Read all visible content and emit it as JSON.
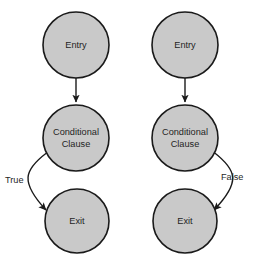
{
  "diagram": {
    "type": "flowchart",
    "title": "",
    "background_color": "#ffffff",
    "node_fill_color": "#c9c9c9",
    "node_stroke_color": "#1a1a1a",
    "text_color": "#1f1f1f",
    "columns": [
      {
        "id": "left",
        "branch_label": "True",
        "branch_side": "left",
        "nodes": [
          {
            "id": "left-entry",
            "label": "Entry",
            "shape": "circle",
            "cx": 76,
            "cy": 45,
            "r": 33
          },
          {
            "id": "left-conditional",
            "label_line1": "Conditional",
            "label_line2": "Clause",
            "shape": "circle",
            "cx": 76,
            "cy": 138,
            "r": 33
          },
          {
            "id": "left-exit",
            "label": "Exit",
            "shape": "circle",
            "cx": 77,
            "cy": 221,
            "r": 32
          }
        ],
        "edges": [
          {
            "id": "left-entry-to-conditional",
            "from": "left-entry",
            "to": "left-conditional",
            "label": "",
            "style": "straight-arrow"
          },
          {
            "id": "left-conditional-to-exit",
            "from": "left-conditional",
            "to": "left-exit",
            "label": "True",
            "style": "curved-arrow"
          }
        ]
      },
      {
        "id": "right",
        "branch_label": "False",
        "branch_side": "right",
        "nodes": [
          {
            "id": "right-entry",
            "label": "Entry",
            "shape": "circle",
            "cx": 185,
            "cy": 45,
            "r": 33
          },
          {
            "id": "right-conditional",
            "label_line1": "Conditional",
            "label_line2": "Clause",
            "shape": "circle",
            "cx": 185,
            "cy": 138,
            "r": 33
          },
          {
            "id": "right-exit",
            "label": "Exit",
            "shape": "circle",
            "cx": 185,
            "cy": 221,
            "r": 32
          }
        ],
        "edges": [
          {
            "id": "right-entry-to-conditional",
            "from": "right-entry",
            "to": "right-conditional",
            "label": "",
            "style": "straight-arrow"
          },
          {
            "id": "right-conditional-to-exit",
            "from": "right-conditional",
            "to": "right-exit",
            "label": "False",
            "style": "curved-arrow"
          }
        ]
      }
    ],
    "labels": {
      "entry": "Entry",
      "conditional_line1": "Conditional",
      "conditional_line2": "Clause",
      "exit": "Exit",
      "true": "True",
      "false": "False"
    }
  }
}
